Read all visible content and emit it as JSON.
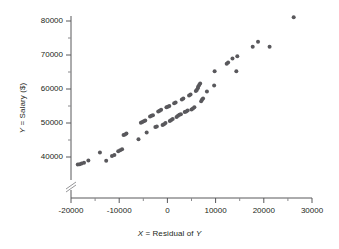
{
  "chart_data": {
    "type": "scatter",
    "title": "",
    "xlabel": "X = Residual of Y",
    "ylabel": "Y = Salary ($)",
    "xlim": [
      -20000,
      30000
    ],
    "ylim": [
      36000,
      82000
    ],
    "xticks": [
      -20000,
      -10000,
      0,
      10000,
      20000,
      30000
    ],
    "xtick_labels": [
      "-20000",
      "-10000",
      "0",
      "10000",
      "20000",
      "30000"
    ],
    "yticks": [
      40000,
      50000,
      60000,
      70000,
      80000
    ],
    "ytick_labels": [
      "40000",
      "50000",
      "60000",
      "70000",
      "80000"
    ],
    "x_minor_tick_interval": 5000,
    "y_minor_tick_interval": 5000,
    "grid": false,
    "legend": "none",
    "y_axis_break": true,
    "y_axis_break_note": "axis break symbol on Y axis below 40000",
    "marker": {
      "shape": "circle",
      "color": "#59585c",
      "size_px": 4
    },
    "points": [
      {
        "x": -18600,
        "y": 37800
      },
      {
        "x": -18200,
        "y": 37900
      },
      {
        "x": -17800,
        "y": 38100
      },
      {
        "x": -17300,
        "y": 38300
      },
      {
        "x": -16400,
        "y": 39000
      },
      {
        "x": -14000,
        "y": 41300
      },
      {
        "x": -12700,
        "y": 38900
      },
      {
        "x": -11500,
        "y": 40300
      },
      {
        "x": -11000,
        "y": 40600
      },
      {
        "x": -10200,
        "y": 41700
      },
      {
        "x": -9800,
        "y": 42000
      },
      {
        "x": -9400,
        "y": 42300
      },
      {
        "x": -9100,
        "y": 46500
      },
      {
        "x": -8800,
        "y": 46600
      },
      {
        "x": -8500,
        "y": 46900
      },
      {
        "x": -6000,
        "y": 45200
      },
      {
        "x": -5500,
        "y": 50100
      },
      {
        "x": -5200,
        "y": 50300
      },
      {
        "x": -4900,
        "y": 50500
      },
      {
        "x": -4600,
        "y": 50700
      },
      {
        "x": -4300,
        "y": 47200
      },
      {
        "x": -3600,
        "y": 51900
      },
      {
        "x": -3300,
        "y": 52100
      },
      {
        "x": -3000,
        "y": 52300
      },
      {
        "x": -2500,
        "y": 48800
      },
      {
        "x": -2200,
        "y": 49000
      },
      {
        "x": -1900,
        "y": 53400
      },
      {
        "x": -1600,
        "y": 53600
      },
      {
        "x": -1300,
        "y": 53900
      },
      {
        "x": -1000,
        "y": 49400
      },
      {
        "x": -700,
        "y": 49600
      },
      {
        "x": -400,
        "y": 50000
      },
      {
        "x": -200,
        "y": 54600
      },
      {
        "x": 100,
        "y": 54800
      },
      {
        "x": 400,
        "y": 55000
      },
      {
        "x": 500,
        "y": 50600
      },
      {
        "x": 800,
        "y": 50900
      },
      {
        "x": 1100,
        "y": 51200
      },
      {
        "x": 1400,
        "y": 55800
      },
      {
        "x": 1700,
        "y": 56000
      },
      {
        "x": 1900,
        "y": 51800
      },
      {
        "x": 2200,
        "y": 52100
      },
      {
        "x": 2500,
        "y": 52400
      },
      {
        "x": 2800,
        "y": 52600
      },
      {
        "x": 3000,
        "y": 56900
      },
      {
        "x": 3300,
        "y": 57200
      },
      {
        "x": 3600,
        "y": 53200
      },
      {
        "x": 3900,
        "y": 53400
      },
      {
        "x": 4200,
        "y": 53700
      },
      {
        "x": 4500,
        "y": 58100
      },
      {
        "x": 4800,
        "y": 58400
      },
      {
        "x": 5000,
        "y": 54000
      },
      {
        "x": 5300,
        "y": 54300
      },
      {
        "x": 5600,
        "y": 54600
      },
      {
        "x": 5900,
        "y": 59400
      },
      {
        "x": 6100,
        "y": 59700
      },
      {
        "x": 6300,
        "y": 60200
      },
      {
        "x": 6400,
        "y": 60700
      },
      {
        "x": 6600,
        "y": 61200
      },
      {
        "x": 6800,
        "y": 61600
      },
      {
        "x": 7000,
        "y": 56400
      },
      {
        "x": 7200,
        "y": 56900
      },
      {
        "x": 7400,
        "y": 57200
      },
      {
        "x": 8200,
        "y": 59300
      },
      {
        "x": 9700,
        "y": 61000
      },
      {
        "x": 9800,
        "y": 65200
      },
      {
        "x": 12300,
        "y": 67400
      },
      {
        "x": 12600,
        "y": 67800
      },
      {
        "x": 13500,
        "y": 69000
      },
      {
        "x": 14300,
        "y": 65200
      },
      {
        "x": 14500,
        "y": 69600
      },
      {
        "x": 17700,
        "y": 72400
      },
      {
        "x": 18800,
        "y": 73900
      },
      {
        "x": 21200,
        "y": 72400
      },
      {
        "x": 26200,
        "y": 81100
      }
    ]
  }
}
